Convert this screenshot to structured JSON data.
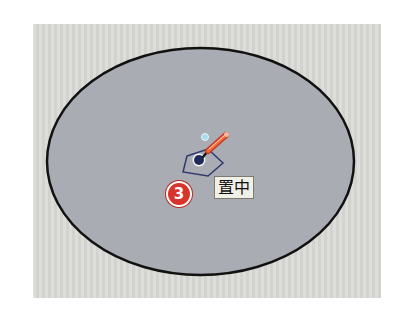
{
  "diagram": {
    "label": "置中",
    "step_badge": "3",
    "colors": {
      "canvas": "#d9d9d6",
      "ellipse_fill": "#a9acb3",
      "ellipse_stroke": "#111111",
      "pentagon_stroke": "#2f3a6e",
      "center_dot": "#1f2a5c",
      "inference_dot": "#a8dcef",
      "badge": "#d9342b",
      "tool_body": "#e8502f"
    },
    "icons": [
      "pencil-tool-icon",
      "center-point-icon",
      "inference-point-icon",
      "pentagon-outline-icon"
    ]
  }
}
